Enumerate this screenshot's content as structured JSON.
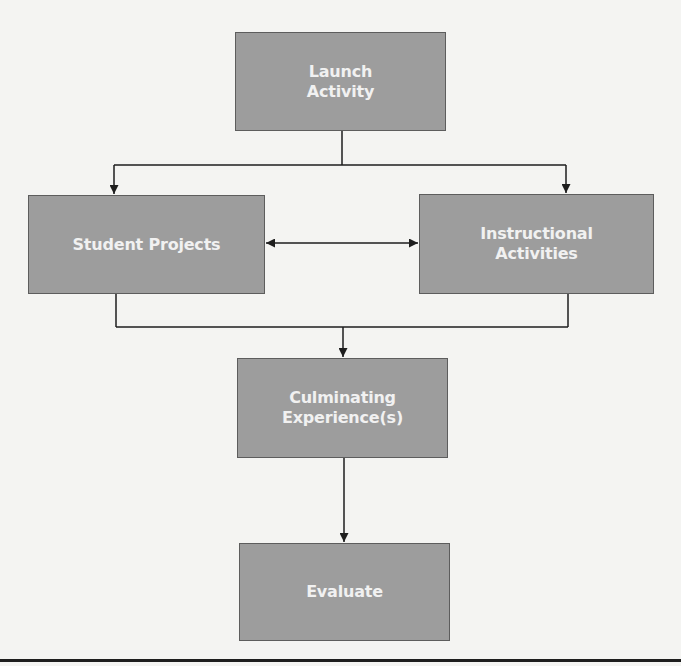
{
  "diagram": {
    "type": "flowchart",
    "colors": {
      "background": "#f4f4f2",
      "box_fill": "#9d9d9d",
      "box_border": "#5d5d5d",
      "box_text": "#f1f1f1",
      "connector": "#1e1e1e"
    },
    "nodes": [
      {
        "id": "launch",
        "label": "Launch\nActivity"
      },
      {
        "id": "student",
        "label": "Student Projects"
      },
      {
        "id": "instructional",
        "label": "Instructional\nActivities"
      },
      {
        "id": "culminating",
        "label": "Culminating\nExperience(s)"
      },
      {
        "id": "evaluate",
        "label": "Evaluate"
      }
    ],
    "edges": [
      {
        "from": "launch",
        "to": "student",
        "style": "arrow"
      },
      {
        "from": "launch",
        "to": "instructional",
        "style": "arrow"
      },
      {
        "from": "student",
        "to": "instructional",
        "style": "double-arrow"
      },
      {
        "from": "student",
        "to": "culminating",
        "style": "arrow"
      },
      {
        "from": "instructional",
        "to": "culminating",
        "style": "arrow"
      },
      {
        "from": "culminating",
        "to": "evaluate",
        "style": "arrow"
      }
    ]
  }
}
